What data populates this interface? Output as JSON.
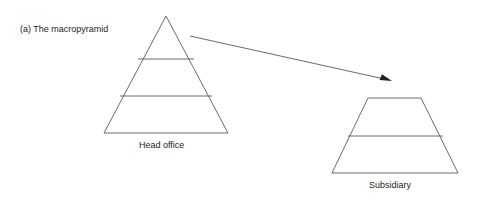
{
  "figure": {
    "width": 477,
    "height": 205,
    "background_color": "#ffffff",
    "stroke_color": "#58595b",
    "text_color": "#231f20",
    "arrow_color": "#231f20",
    "title": "(a) The macropyramid"
  },
  "labels": {
    "title": "(a) The macropyramid",
    "head_office": "Head office",
    "subsidiary": "Subsidiary"
  },
  "shapes": {
    "pyramid": {
      "name": "Head office",
      "type": "triangle",
      "apex": {
        "x": 166,
        "y": 16
      },
      "base_left": {
        "x": 104,
        "y": 133
      },
      "base_right": {
        "x": 228,
        "y": 133
      },
      "tier_count": 3,
      "dividers": [
        {
          "y": 59,
          "x1": 138,
          "x2": 194
        },
        {
          "y": 96,
          "x1": 120,
          "x2": 212
        }
      ]
    },
    "subsidiary": {
      "name": "Subsidiary",
      "type": "trapezoid",
      "top_left": {
        "x": 368,
        "y": 98
      },
      "top_right": {
        "x": 421,
        "y": 98
      },
      "bottom_left": {
        "x": 332,
        "y": 173
      },
      "bottom_right": {
        "x": 458,
        "y": 173
      },
      "tier_count": 2,
      "dividers": [
        {
          "y": 136,
          "x1": 348,
          "x2": 443
        }
      ]
    }
  },
  "arrow": {
    "from": {
      "x": 190,
      "y": 36
    },
    "to": {
      "x": 392,
      "y": 81
    },
    "head_length": 11,
    "head_width": 6
  }
}
